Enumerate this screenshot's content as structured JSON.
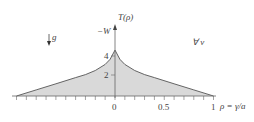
{
  "chart_data": {
    "type": "area",
    "title": "",
    "xlabel": "ρ = γ/a",
    "ylabel": "T(ρ)",
    "y_axis_top_label": "−W",
    "annotations": [
      "↓g",
      "∀ v"
    ],
    "x_tick_labels": [
      "0",
      "0.5",
      "1"
    ],
    "y_tick_labels": [
      "2",
      "4"
    ],
    "xlim": [
      -1,
      1
    ],
    "ylim": [
      0,
      5.5
    ],
    "minor_tick_step": 0.1,
    "grid": false,
    "fill_color": "#d9d9d9",
    "line_color": "#555555",
    "x": [
      -1.0,
      -0.8,
      -0.6,
      -0.4,
      -0.3,
      -0.2,
      -0.1,
      -0.05,
      0.0,
      0.05,
      0.1,
      0.2,
      0.3,
      0.4,
      0.6,
      0.8,
      1.0
    ],
    "values": [
      0.0,
      0.6,
      1.2,
      1.8,
      2.1,
      2.5,
      3.1,
      3.6,
      4.5,
      3.6,
      3.1,
      2.5,
      2.1,
      1.8,
      1.2,
      0.6,
      0.0
    ]
  },
  "labels": {
    "ylabel": "T(ρ)",
    "y_top": "−W",
    "gravity": "g",
    "forall": "∀ v",
    "xlabel": "ρ = γ/a",
    "x0": "0",
    "x05": "0.5",
    "x1": "1",
    "y2": "2",
    "y4": "4"
  }
}
